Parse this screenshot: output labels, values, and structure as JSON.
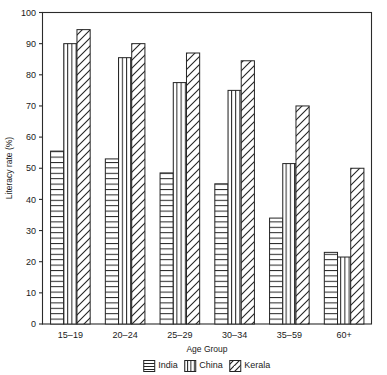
{
  "chart_data": {
    "type": "bar",
    "title": "",
    "xlabel": "Age Group",
    "ylabel": "Literacy rate (%)",
    "ylim": [
      0,
      100
    ],
    "yticks": [
      0,
      10,
      20,
      30,
      40,
      50,
      60,
      70,
      80,
      90,
      100
    ],
    "ytick_labels": [
      "0",
      "10",
      "20",
      "30",
      "40",
      "50",
      "60",
      "70",
      "80",
      "90",
      "100"
    ],
    "grid": false,
    "legend_position": "bottom",
    "categories": [
      "15–19",
      "20–24",
      "25–29",
      "30–34",
      "35–59",
      "60+"
    ],
    "series": [
      {
        "name": "India",
        "pattern": "horizontal-lines",
        "color": "#ffffff",
        "edge_color": "#242424",
        "values": [
          55.5,
          53,
          48.5,
          45,
          34,
          23
        ]
      },
      {
        "name": "China",
        "pattern": "vertical-lines",
        "color": "#ffffff",
        "edge_color": "#242424",
        "values": [
          90,
          85.5,
          77.5,
          75,
          51.5,
          21.5
        ]
      },
      {
        "name": "Kerala",
        "pattern": "diagonal-hatch",
        "color": "#ffffff",
        "edge_color": "#242424",
        "values": [
          94.5,
          90,
          87,
          84.5,
          70,
          50
        ]
      }
    ]
  },
  "legend": {
    "items": [
      {
        "label": "India",
        "pattern": "horizontal-lines"
      },
      {
        "label": "China",
        "pattern": "vertical-lines"
      },
      {
        "label": "Kerala",
        "pattern": "diagonal-hatch"
      }
    ]
  },
  "axes": {
    "y_label": "Literacy rate (%)",
    "x_label": "Age Group"
  }
}
